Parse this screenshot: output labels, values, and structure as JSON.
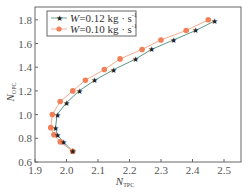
{
  "chart_data": {
    "type": "line",
    "title": "",
    "xlabel": "N_TPC",
    "ylabel": "N_OPC",
    "xlabel_main": "N",
    "xlabel_sub": "TPC",
    "ylabel_main": "N",
    "ylabel_sub": "OPC",
    "xlim": [
      1.9,
      2.55
    ],
    "ylim": [
      0.6,
      1.9
    ],
    "xticks": [
      "1.9",
      "2.0",
      "2.1",
      "2.2",
      "2.3",
      "2.4",
      "2.5"
    ],
    "yticks": [
      "0.6",
      "0.8",
      "1.0",
      "1.2",
      "1.4",
      "1.6",
      "1.8"
    ],
    "grid": false,
    "legend_position": "upper left",
    "series": [
      {
        "name": "W=0.12 kg·s⁻¹",
        "legend_label": "=0.12 kg · s",
        "color": "#222222",
        "line_color": "#4a8a78",
        "marker": "star",
        "x": [
          2.02,
          1.99,
          1.97,
          1.965,
          1.97,
          2.0,
          2.04,
          2.09,
          2.15,
          2.22,
          2.27,
          2.34,
          2.41,
          2.47
        ],
        "y": [
          0.69,
          0.77,
          0.83,
          0.89,
          1.0,
          1.1,
          1.2,
          1.29,
          1.38,
          1.47,
          1.55,
          1.63,
          1.71,
          1.79
        ]
      },
      {
        "name": "W=0.10 kg·s⁻¹",
        "legend_label": "=0.10 kg · s",
        "color": "#f0805a",
        "line_color": "#f0a080",
        "marker": "circle",
        "x": [
          2.02,
          1.98,
          1.96,
          1.95,
          1.955,
          1.98,
          2.02,
          2.06,
          2.12,
          2.17,
          2.24,
          2.3,
          2.38,
          2.45
        ],
        "y": [
          0.69,
          0.77,
          0.83,
          0.89,
          1.0,
          1.11,
          1.2,
          1.29,
          1.38,
          1.47,
          1.55,
          1.63,
          1.71,
          1.8
        ]
      }
    ],
    "legend": {
      "var": "W",
      "unit_sup": "-1"
    }
  }
}
